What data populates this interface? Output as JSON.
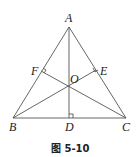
{
  "figure": {
    "caption": "图 5-10",
    "points": {
      "A": {
        "label": "A",
        "x": 69,
        "y": 27
      },
      "B": {
        "label": "B",
        "x": 13,
        "y": 118
      },
      "C": {
        "label": "C",
        "x": 126,
        "y": 118
      },
      "D": {
        "label": "D",
        "x": 69,
        "y": 118
      },
      "E": {
        "label": "E",
        "x": 96,
        "y": 70
      },
      "F": {
        "label": "F",
        "x": 41,
        "y": 71
      },
      "O": {
        "label": "O",
        "x": 69,
        "y": 88
      }
    },
    "segments": [
      "AB",
      "AC",
      "BC",
      "AD",
      "BE",
      "CF"
    ],
    "right_angles": [
      "D",
      "E",
      "F"
    ],
    "line_color": "#555555"
  }
}
